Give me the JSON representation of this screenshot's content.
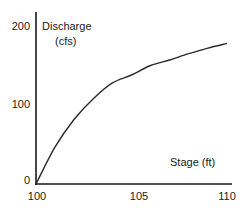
{
  "chart_data": {
    "type": "line",
    "title": "",
    "xlabel": "Stage (ft)",
    "ylabel": "Discharge (cfs)",
    "ylabel_lines": [
      "Discharge",
      "(cfs)"
    ],
    "xlim": [
      100,
      110
    ],
    "ylim": [
      0,
      200
    ],
    "x_ticks": [
      "100",
      "105",
      "110"
    ],
    "y_ticks": [
      "0",
      "100",
      "200"
    ],
    "grid": false,
    "legend": null,
    "series": [
      {
        "name": "Rating curve",
        "x": [
          100,
          101,
          102,
          103,
          104,
          105,
          106,
          107,
          108,
          109,
          110
        ],
        "values": [
          0,
          47,
          82,
          108,
          128,
          138,
          150,
          157,
          165,
          172,
          178
        ]
      }
    ]
  },
  "colors": {
    "line": "#2b2b2b",
    "axis": "#1a1a1a",
    "background": "#ffffff"
  }
}
